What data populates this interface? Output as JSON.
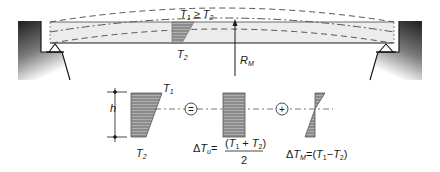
{
  "diagram": {
    "beam": {
      "condition_label": "T1 ≥ T2",
      "condition_parts": {
        "t1": "T",
        "t1_sub": "1",
        "op": " ≥ ",
        "t2": "T",
        "t2_sub": "2"
      },
      "section_label": {
        "t": "T",
        "sub": "2"
      },
      "reaction_label": {
        "r": "R",
        "sub": "M"
      }
    },
    "decomposition": {
      "height_label": "h",
      "total": {
        "top_label": {
          "t": "T",
          "sub": "1"
        },
        "bottom_label": {
          "t": "T",
          "sub": "2"
        }
      },
      "equals_symbol": "=",
      "plus_symbol": "+",
      "uniform": {
        "delta": "Δ",
        "t": "T",
        "sub": "u",
        "eq": "=",
        "numerator": "(T1 + T2)",
        "numerator_parts": {
          "open": "(",
          "t1": "T",
          "t1_sub": "1",
          "plus": " + ",
          "t2": "T",
          "t2_sub": "2",
          "close": ")"
        },
        "denominator": "2"
      },
      "gradient": {
        "delta": "Δ",
        "t": "T",
        "sub": "M",
        "eq": "=",
        "expr": "(T1 − T2)",
        "expr_parts": {
          "open": "(",
          "t1": "T",
          "t1_sub": "1",
          "minus": "−",
          "t2": "T",
          "t2_sub": "2",
          "close": ")"
        }
      }
    },
    "colors": {
      "beam_fill": "#ececec",
      "hatch_fill": "#8c8c8c",
      "line": "#1a1a1a",
      "dash": "#555555",
      "abutment_dark": "#1e1e1e"
    }
  }
}
